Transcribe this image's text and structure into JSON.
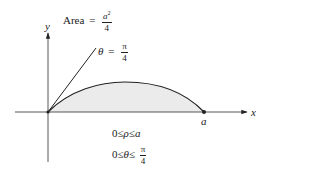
{
  "diagram": {
    "area_label": {
      "prefix": "Area",
      "equals": "=",
      "numerator_base": "a",
      "numerator_exp": "2",
      "denominator": "4"
    },
    "angle_label": {
      "var": "θ",
      "equals": "=",
      "numerator": "π",
      "denominator": "4"
    },
    "axes": {
      "x_label": "x",
      "y_label": "y"
    },
    "point_label": "a",
    "constraints": {
      "rho_line": {
        "low": "0",
        "le1": "≤",
        "var": "ρ",
        "le2": "≤",
        "high": "a"
      },
      "theta_line": {
        "low": "0",
        "le1": "≤",
        "var": "θ",
        "le2": "≤",
        "numerator": "π",
        "denominator": "4"
      }
    },
    "colors": {
      "stroke": "#222222",
      "region_fill": "#ebebeb",
      "axis": "#444444"
    }
  }
}
